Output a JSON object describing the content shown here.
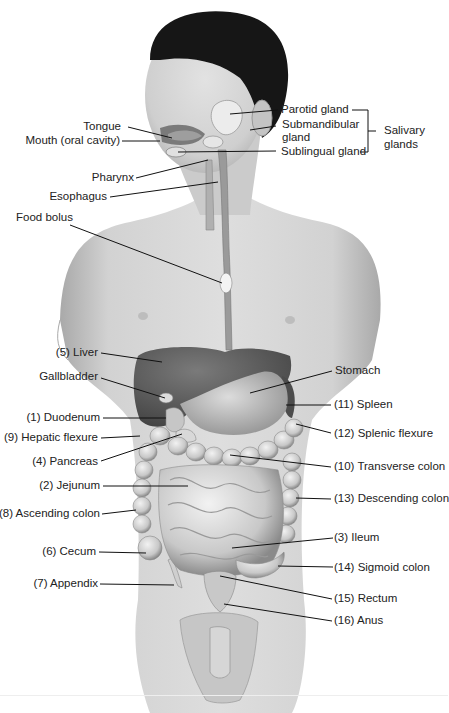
{
  "figure": {
    "colors": {
      "background": "#ffffff",
      "skin": "#d4d4d4",
      "skin_dark": "#a9a9a9",
      "hair": "#161616",
      "organ_dark": "#5c5c5c",
      "organ_mid": "#9a9a9a",
      "organ_light": "#e4e4e4",
      "label_text": "#222222",
      "leader_line": "#111111"
    }
  },
  "labels_left": [
    {
      "id": "tongue",
      "text": "Tongue"
    },
    {
      "id": "mouth",
      "text": "Mouth (oral cavity)"
    },
    {
      "id": "pharynx",
      "text": "Pharynx"
    },
    {
      "id": "esophagus",
      "text": "Esophagus"
    },
    {
      "id": "food_bolus",
      "text": "Food bolus"
    },
    {
      "id": "liver",
      "text": "(5) Liver"
    },
    {
      "id": "gallbladder",
      "text": "Gallbladder"
    },
    {
      "id": "duodenum",
      "text": "(1) Duodenum"
    },
    {
      "id": "hepatic_flexure",
      "text": "(9) Hepatic flexure"
    },
    {
      "id": "pancreas",
      "text": "(4) Pancreas"
    },
    {
      "id": "jejunum",
      "text": "(2) Jejunum"
    },
    {
      "id": "ascending_colon",
      "text": "(8) Ascending colon"
    },
    {
      "id": "cecum",
      "text": "(6) Cecum"
    },
    {
      "id": "appendix",
      "text": "(7) Appendix"
    }
  ],
  "labels_right": [
    {
      "id": "parotid",
      "text": "Parotid gland"
    },
    {
      "id": "submandibular_1",
      "text": "Submandibular"
    },
    {
      "id": "submandibular_2",
      "text": "gland"
    },
    {
      "id": "sublingual",
      "text": "Sublingual gland"
    },
    {
      "id": "salivary_1",
      "text": "Salivary"
    },
    {
      "id": "salivary_2",
      "text": "glands"
    },
    {
      "id": "stomach",
      "text": "Stomach"
    },
    {
      "id": "spleen",
      "text": "(11) Spleen"
    },
    {
      "id": "splenic_flexure",
      "text": "(12) Splenic flexure"
    },
    {
      "id": "transverse_colon",
      "text": "(10) Transverse colon"
    },
    {
      "id": "descending_colon",
      "text": "(13) Descending colon"
    },
    {
      "id": "ileum",
      "text": "(3) Ileum"
    },
    {
      "id": "sigmoid_colon",
      "text": "(14) Sigmoid colon"
    },
    {
      "id": "rectum",
      "text": "(15) Rectum"
    },
    {
      "id": "anus",
      "text": "(16) Anus"
    }
  ]
}
